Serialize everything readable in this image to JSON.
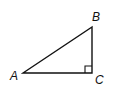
{
  "diagram": {
    "type": "right-triangle",
    "vertices": [
      {
        "label": "A",
        "x": 23,
        "y": 73
      },
      {
        "label": "B",
        "x": 92,
        "y": 27
      },
      {
        "label": "C",
        "x": 92,
        "y": 73
      }
    ],
    "right_angle_at": "C",
    "stroke_color": "#111111"
  }
}
